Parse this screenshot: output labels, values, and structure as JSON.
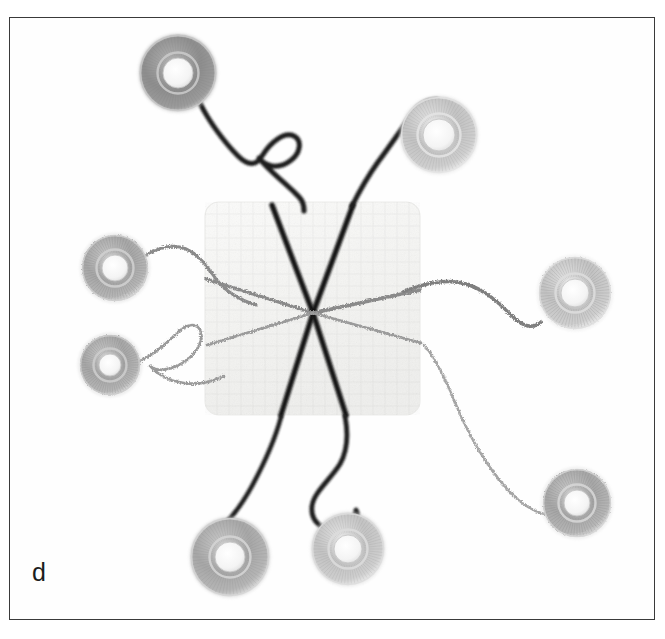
{
  "figure": {
    "panel_label": "d",
    "caption_visible": false,
    "background_color": "#ffffff",
    "frame_border_color": "#3a3a3a",
    "frame": {
      "x": 9,
      "y": 17,
      "width": 646,
      "height": 603
    }
  },
  "scene": {
    "description": "Surgical suture demonstration: a square white woven gauze pad at center with eight suture threads radiating outward, each terminating at a circular spool.",
    "pad": {
      "name": "gauze-pad",
      "x": 205,
      "y": 202,
      "width": 215,
      "height": 213,
      "corner_radius": 14,
      "fill": "#f7f7f5",
      "edge": "#ececea",
      "texture": "woven-weave"
    },
    "convergence_point": {
      "x": 313,
      "y": 313
    }
  },
  "spools": [
    {
      "name": "spool-top-left",
      "cx": 178,
      "cy": 73,
      "outer_r": 38,
      "inner_r": 15,
      "outer_color": "#8d8d8d",
      "rim_color": "#c9c9c9",
      "hole_color": "#f0f0f0",
      "style": "smooth-dark-grey"
    },
    {
      "name": "spool-top-right",
      "cx": 439,
      "cy": 135,
      "outer_r": 38,
      "inner_r": 16,
      "outer_color": "#c7c7c7",
      "rim_color": "#e3e3e3",
      "hole_color": "#fafafa",
      "style": "striated-light-grey"
    },
    {
      "name": "spool-left-upper",
      "cx": 115,
      "cy": 268,
      "outer_r": 33,
      "inner_r": 13,
      "outer_color": "#a3a3a3",
      "rim_color": "#cfcfcf",
      "hole_color": "#f2f2f2",
      "style": "fuzzy-grey"
    },
    {
      "name": "spool-left-lower",
      "cx": 110,
      "cy": 365,
      "outer_r": 30,
      "inner_r": 11,
      "outer_color": "#9e9e9e",
      "rim_color": "#cccccc",
      "hole_color": "#f3f3f3",
      "style": "fuzzy-grey"
    },
    {
      "name": "spool-right",
      "cx": 575,
      "cy": 293,
      "outer_r": 36,
      "inner_r": 14,
      "outer_color": "#c2c2c2",
      "rim_color": "#dddddd",
      "hole_color": "#fbfbfb",
      "style": "fuzzy-light-grey"
    },
    {
      "name": "spool-bottom-right",
      "cx": 577,
      "cy": 503,
      "outer_r": 34,
      "inner_r": 13,
      "outer_color": "#b0b0b0",
      "rim_color": "#d6d6d6",
      "hole_color": "#f7f7f7",
      "style": "fuzzy-grey"
    },
    {
      "name": "spool-bottom-left",
      "cx": 230,
      "cy": 557,
      "outer_r": 39,
      "inner_r": 15,
      "outer_color": "#a8a8a8",
      "rim_color": "#d4d4d4",
      "hole_color": "#f6f6f6",
      "style": "smooth-grey"
    },
    {
      "name": "spool-bottom-center",
      "cx": 348,
      "cy": 549,
      "outer_r": 36,
      "inner_r": 14,
      "outer_color": "#bdbdbd",
      "rim_color": "#dcdcdc",
      "hole_color": "#fbfbfb",
      "style": "smooth-light-grey"
    }
  ],
  "threads": [
    {
      "name": "thread-upper-left-dark",
      "type": "monofilament-dark",
      "color": "#1f1f1f",
      "width": 5.0,
      "has_loop": true,
      "path": "M 200 103 C 208 120 224 142 238 156 C 248 166 256 166 262 156 C 270 143 284 131 294 136 C 303 141 300 154 290 161 C 278 170 265 166 259 158 C 268 170 282 180 292 190 C 300 198 304 200 304 211"
    },
    {
      "name": "thread-upper-right-dark",
      "type": "monofilament-dark",
      "color": "#1f1f1f",
      "width": 5.0,
      "has_loop": false,
      "path": "M 437 100 C 428 100 420 104 414 112 C 402 128 390 146 378 162 C 368 176 360 190 352 206"
    },
    {
      "name": "thread-left-braided",
      "type": "braided-fuzzy",
      "color": "#8b8b8b",
      "width": 3.0,
      "has_loop": false,
      "path": "M 143 257 C 156 248 172 243 186 249 C 200 255 208 268 216 279 C 226 292 240 300 256 305"
    },
    {
      "name": "thread-left-loop-braided",
      "type": "braided-fuzzy",
      "color": "#9a9a9a",
      "width": 2.6,
      "has_loop": true,
      "path": "M 138 362 C 152 356 166 344 176 334 C 186 324 196 322 200 330 C 205 340 196 354 184 362 C 170 371 156 372 150 366 C 158 375 170 381 184 383 C 198 385 212 382 224 376"
    },
    {
      "name": "thread-right-braided",
      "type": "braided-fuzzy",
      "color": "#7f7f7f",
      "width": 3.4,
      "has_loop": false,
      "path": "M 404 291 C 424 284 446 278 466 284 C 486 290 500 304 512 316 C 522 326 532 330 541 322"
    },
    {
      "name": "thread-bottom-right-braided",
      "type": "braided-fuzzy",
      "color": "#a5a5a5",
      "width": 2.4,
      "has_loop": false,
      "path": "M 424 345 C 434 356 444 376 454 400 C 468 434 486 466 508 490 C 522 505 534 512 545 514"
    },
    {
      "name": "thread-bottom-left-dark",
      "type": "monofilament-dark",
      "color": "#1f1f1f",
      "width": 4.6,
      "has_loop": false,
      "path": "M 281 417 C 276 436 266 460 252 486 C 240 508 226 526 209 538"
    },
    {
      "name": "thread-bottom-center-dark",
      "type": "monofilament-dark",
      "color": "#1f1f1f",
      "width": 4.8,
      "has_loop": true,
      "path": "M 345 416 C 348 432 348 450 340 464 C 330 480 314 492 312 506 C 310 522 324 533 340 529 C 354 526 360 516 356 510 C 354 522 350 532 349 540"
    }
  ],
  "sutures": [
    {
      "name": "suture-nw-dark",
      "color": "#141414",
      "width": 5.4,
      "from": {
        "x": 313,
        "y": 313
      },
      "to": {
        "x": 272,
        "y": 205
      }
    },
    {
      "name": "suture-ne-dark",
      "color": "#141414",
      "width": 5.4,
      "from": {
        "x": 313,
        "y": 313
      },
      "to": {
        "x": 353,
        "y": 205
      }
    },
    {
      "name": "suture-sw-dark",
      "color": "#141414",
      "width": 5.4,
      "from": {
        "x": 313,
        "y": 313
      },
      "to": {
        "x": 281,
        "y": 415
      }
    },
    {
      "name": "suture-se-dark",
      "color": "#141414",
      "width": 5.4,
      "from": {
        "x": 313,
        "y": 313
      },
      "to": {
        "x": 346,
        "y": 415
      }
    },
    {
      "name": "suture-w-braided",
      "color": "#8a8a8a",
      "width": 3.2,
      "from": {
        "x": 313,
        "y": 313
      },
      "to": {
        "x": 206,
        "y": 279
      }
    },
    {
      "name": "suture-e-braided",
      "color": "#8a8a8a",
      "width": 3.4,
      "from": {
        "x": 313,
        "y": 313
      },
      "to": {
        "x": 420,
        "y": 290
      }
    },
    {
      "name": "suture-wsw-braided",
      "color": "#9b9b9b",
      "width": 2.6,
      "from": {
        "x": 313,
        "y": 313
      },
      "to": {
        "x": 207,
        "y": 345
      }
    },
    {
      "name": "suture-ese-braided",
      "color": "#9b9b9b",
      "width": 2.6,
      "from": {
        "x": 313,
        "y": 313
      },
      "to": {
        "x": 421,
        "y": 343
      }
    }
  ]
}
